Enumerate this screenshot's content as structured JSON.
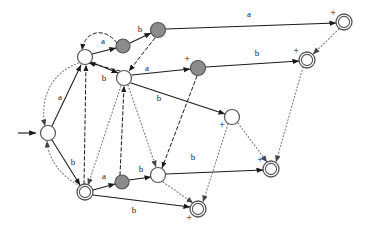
{
  "figure": {
    "kind": "state-transition-diagram",
    "background_color": "#ffffff",
    "width": 368,
    "height": 236,
    "colors": {
      "node_fill_white": "#ffffff",
      "node_fill_gray": "#8c8c8c",
      "node_stroke": "#555555",
      "edge_solid": "#1a1a1a",
      "edge_dashed": "#1a1a1a",
      "edge_dotted": "#777777",
      "label_text": "#1a1a1a"
    }
  },
  "start": {
    "arrow_label": "start-arrow",
    "target_node": "q0"
  },
  "nodes": [
    {
      "id": "q0",
      "x": 48,
      "y": 133,
      "r": 7.5,
      "fill": "white",
      "double": false,
      "accepting_mark": "",
      "mark_dx": 0,
      "mark_dy": 0
    },
    {
      "id": "q1",
      "x": 85,
      "y": 57,
      "r": 7.5,
      "fill": "white",
      "double": false,
      "accepting_mark": "",
      "mark_dx": 0,
      "mark_dy": 0
    },
    {
      "id": "q2",
      "x": 124,
      "y": 78,
      "r": 7.5,
      "fill": "white",
      "double": false,
      "accepting_mark": "",
      "mark_dx": 0,
      "mark_dy": 0
    },
    {
      "id": "q3",
      "x": 123,
      "y": 46,
      "r": 7.0,
      "fill": "gray",
      "double": false,
      "accepting_mark": "",
      "mark_dx": 0,
      "mark_dy": 0
    },
    {
      "id": "q4",
      "x": 158,
      "y": 30,
      "r": 7.5,
      "fill": "gray",
      "double": false,
      "accepting_mark": "",
      "mark_dx": 0,
      "mark_dy": 0
    },
    {
      "id": "q5",
      "x": 344,
      "y": 22,
      "r": 8.0,
      "fill": "white",
      "double": true,
      "accepting_mark": "+",
      "mark_dx": -11,
      "mark_dy": -8
    },
    {
      "id": "q6",
      "x": 198,
      "y": 68,
      "r": 7.5,
      "fill": "gray",
      "double": false,
      "accepting_mark": "+",
      "mark_dx": -11,
      "mark_dy": -8
    },
    {
      "id": "q7",
      "x": 307,
      "y": 60,
      "r": 8.0,
      "fill": "white",
      "double": true,
      "accepting_mark": "+",
      "mark_dx": -11,
      "mark_dy": -8
    },
    {
      "id": "q8",
      "x": 232,
      "y": 117,
      "r": 7.5,
      "fill": "white",
      "double": false,
      "accepting_mark": "+",
      "mark_dx": -10,
      "mark_dy": 9
    },
    {
      "id": "q9",
      "x": 271,
      "y": 169,
      "r": 8.0,
      "fill": "white",
      "double": true,
      "accepting_mark": "+",
      "mark_dx": -11,
      "mark_dy": -8
    },
    {
      "id": "q10",
      "x": 85,
      "y": 192,
      "r": 8.0,
      "fill": "white",
      "double": true,
      "accepting_mark": "",
      "mark_dx": 0,
      "mark_dy": 0
    },
    {
      "id": "q11",
      "x": 122,
      "y": 182,
      "r": 7.0,
      "fill": "gray",
      "double": false,
      "accepting_mark": "",
      "mark_dx": 0,
      "mark_dy": 0
    },
    {
      "id": "q12",
      "x": 158,
      "y": 175,
      "r": 7.5,
      "fill": "white",
      "double": false,
      "accepting_mark": "",
      "mark_dx": 0,
      "mark_dy": 0
    },
    {
      "id": "q13",
      "x": 198,
      "y": 209,
      "r": 8.0,
      "fill": "white",
      "double": true,
      "accepting_mark": "+",
      "mark_dx": -9,
      "mark_dy": 10
    }
  ],
  "edges": [
    {
      "id": "e1",
      "from": "q1",
      "to": "q3",
      "label": "a",
      "style": "solid",
      "lx": 103,
      "ly": 42,
      "path": "M 92 54 L 116 48"
    },
    {
      "id": "e2",
      "from": "q3",
      "to": "q4",
      "label": "b",
      "style": "solid",
      "lx": 140,
      "ly": 30,
      "path": "M 130 43 L 151 33"
    },
    {
      "id": "e3",
      "from": "q4",
      "to": "q5",
      "label": "a",
      "style": "solid",
      "lx": 249,
      "ly": 15,
      "path": "M 166 29 L 336 23"
    },
    {
      "id": "e4",
      "from": "q1",
      "to": "q2",
      "label": "b",
      "style": "solid",
      "lx": 104,
      "ly": 79,
      "path": "M 91 62 L 118 73"
    },
    {
      "id": "e5",
      "from": "q2",
      "to": "q6",
      "label": "a",
      "style": "solid",
      "lx": 147,
      "ly": 69,
      "path": "M 132 75 L 190 69"
    },
    {
      "id": "e6",
      "from": "q6",
      "to": "q7",
      "label": "b",
      "style": "solid",
      "lx": 257,
      "ly": 54,
      "path": "M 206 67 L 299 61"
    },
    {
      "id": "e7",
      "from": "q2",
      "to": "q8",
      "label": "b",
      "style": "solid",
      "lx": 159,
      "ly": 99,
      "path": "M 131 83 L 225 114"
    },
    {
      "id": "e8",
      "from": "q0",
      "to": "q1",
      "label": "a",
      "style": "solid",
      "lx": 60,
      "ly": 98,
      "path": "M 52 126 L 81 65"
    },
    {
      "id": "e9",
      "from": "q0",
      "to": "q10",
      "label": "b",
      "style": "solid",
      "lx": 73,
      "ly": 163,
      "path": "M 52 140 L 80 185"
    },
    {
      "id": "e10",
      "from": "q10",
      "to": "q11",
      "label": "a",
      "style": "solid",
      "lx": 104,
      "ly": 177,
      "path": "M 93 190 L 115 184"
    },
    {
      "id": "e11",
      "from": "q11",
      "to": "q12",
      "label": "b",
      "style": "solid",
      "lx": 141,
      "ly": 170,
      "path": "M 129 180 L 151 177"
    },
    {
      "id": "e12",
      "from": "q12",
      "to": "q9",
      "label": "b",
      "style": "solid",
      "lx": 193,
      "ly": 158,
      "path": "M 166 174 L 263 170"
    },
    {
      "id": "e13",
      "from": "q10",
      "to": "q13",
      "label": "b",
      "style": "solid",
      "lx": 134,
      "ly": 211,
      "path": "M 93 195 L 190 207"
    },
    {
      "id": "e14",
      "from": "q1",
      "to": "q1",
      "label": "",
      "style": "dashed",
      "lx": 0,
      "ly": 0,
      "path": "M 117 43 C 105 27 85 30 82 50"
    },
    {
      "id": "e15",
      "from": "q4",
      "to": "q2",
      "label": "",
      "style": "dashed",
      "lx": 0,
      "ly": 0,
      "path": "M 155 38 L 129 71"
    },
    {
      "id": "e16",
      "from": "q2",
      "to": "q1",
      "label": "",
      "style": "dashed",
      "lx": 0,
      "ly": 0,
      "path": "M 120 71 L 89 63"
    },
    {
      "id": "e17",
      "from": "q6",
      "to": "q12",
      "label": "",
      "style": "dashed",
      "lx": 0,
      "ly": 0,
      "path": "M 197 76 L 162 168"
    },
    {
      "id": "e18",
      "from": "q10",
      "to": "q1",
      "label": "",
      "style": "dashed",
      "lx": 0,
      "ly": 0,
      "path": "M 84 184 L 86 65"
    },
    {
      "id": "e19",
      "from": "q11",
      "to": "q2",
      "label": "",
      "style": "dashed",
      "lx": 0,
      "ly": 0,
      "path": "M 120 175 L 124 86"
    },
    {
      "id": "e20",
      "from": "q0",
      "to": "q1",
      "label": "",
      "style": "dotted",
      "lx": 0,
      "ly": 0,
      "path": "M 82 62 C 48 72 40 102 45 126"
    },
    {
      "id": "e21",
      "from": "q10",
      "to": "q0",
      "label": "",
      "style": "dotted",
      "lx": 0,
      "ly": 0,
      "path": "M 80 186 C 60 176 48 158 47 141"
    },
    {
      "id": "e22",
      "from": "q2",
      "to": "q10",
      "label": "",
      "style": "dotted",
      "lx": 0,
      "ly": 0,
      "path": "M 121 86 L 88 185"
    },
    {
      "id": "e23",
      "from": "q2",
      "to": "q12",
      "label": "",
      "style": "dotted",
      "lx": 0,
      "ly": 0,
      "path": "M 128 85 L 156 167"
    },
    {
      "id": "e24",
      "from": "q5",
      "to": "q7",
      "label": "",
      "style": "dotted",
      "lx": 0,
      "ly": 0,
      "path": "M 339 29 L 313 54"
    },
    {
      "id": "e25",
      "from": "q7",
      "to": "q9",
      "label": "",
      "style": "dotted",
      "lx": 0,
      "ly": 0,
      "path": "M 303 67 L 276 162"
    },
    {
      "id": "e26",
      "from": "q8",
      "to": "q9",
      "label": "",
      "style": "dotted",
      "lx": 0,
      "ly": 0,
      "path": "M 238 123 L 267 162"
    },
    {
      "id": "e27",
      "from": "q8",
      "to": "q13",
      "label": "",
      "style": "dotted",
      "lx": 0,
      "ly": 0,
      "path": "M 228 124 L 203 202"
    },
    {
      "id": "e28",
      "from": "q12",
      "to": "q13",
      "label": "",
      "style": "dotted",
      "lx": 0,
      "ly": 0,
      "path": "M 163 182 L 193 203"
    }
  ],
  "labels": {
    "alphabet_a": "a",
    "alphabet_b": "b",
    "accept_marker": "+"
  }
}
